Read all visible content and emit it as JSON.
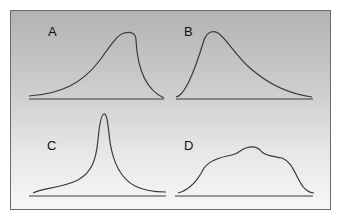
{
  "panels": [
    {
      "label": "A",
      "shape": "left-skewed (negatively skewed) distribution"
    },
    {
      "label": "B",
      "shape": "right-skewed (positively skewed) distribution"
    },
    {
      "label": "C",
      "shape": "leptokurtic (sharp peaked) distribution"
    },
    {
      "label": "D",
      "shape": "platykurtic (flat, broad) distribution"
    }
  ],
  "colors": {
    "curve": "#3a3a3a",
    "axis": "#3a3a3a",
    "frame": "#6a6a6a"
  }
}
